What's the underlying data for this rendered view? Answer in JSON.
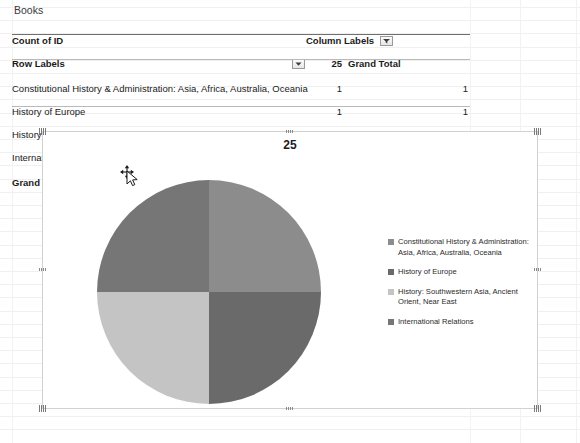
{
  "sheet": {
    "name_label": "Books"
  },
  "pivot": {
    "value_field": "Count of ID",
    "row_labels_header": "Row Labels",
    "column_labels_header": "Column Labels",
    "row_filter_icon": "filter-dropdown-icon",
    "column_filter_icon": "filter-dropdown-icon",
    "column_headers": [
      "25",
      "Grand Total"
    ],
    "rows": [
      {
        "label": "Constitutional History & Administration: Asia, Africa, Australia, Oceania",
        "values": [
          "1",
          "1"
        ]
      },
      {
        "label": "History of Europe",
        "values": [
          "1",
          "1"
        ]
      },
      {
        "label": "History: Southwestern Asia, Ancient Orient, Near East",
        "values": [
          "1",
          "1"
        ]
      },
      {
        "label": "International Relations",
        "values": [
          "1",
          "1"
        ]
      }
    ],
    "total_row": {
      "label": "Grand Total",
      "values": [
        "4",
        "4"
      ]
    }
  },
  "chart": {
    "title": "25",
    "selected": true,
    "cursor": "move-cursor"
  },
  "chart_data": {
    "type": "pie",
    "title": "25",
    "xlabel": "",
    "ylabel": "",
    "legend_position": "right",
    "categories": [
      "Constitutional History & Administration: Asia, Africa, Australia, Oceania",
      "History of Europe",
      "History: Southwestern Asia, Ancient Orient, Near East",
      "International Relations"
    ],
    "values": [
      1,
      1,
      1,
      1
    ],
    "percentages": [
      25,
      25,
      25,
      25
    ],
    "colors": [
      "#8c8c8c",
      "#6a6a6a",
      "#c4c4c4",
      "#767676"
    ],
    "slice_order_clockwise_from_top": [
      "Constitutional History & Administration: Asia, Africa, Australia, Oceania",
      "History of Europe",
      "History: Southwestern Asia, Ancient Orient, Near East",
      "International Relations"
    ]
  },
  "legend": [
    {
      "label": "Constitutional History & Administration: Asia, Africa, Australia, Oceania",
      "color": "#8c8c8c"
    },
    {
      "label": "History of Europe",
      "color": "#6a6a6a"
    },
    {
      "label": "History: Southwestern Asia, Ancient Orient, Near East",
      "color": "#c4c4c4"
    },
    {
      "label": "International Relations",
      "color": "#767676"
    }
  ]
}
